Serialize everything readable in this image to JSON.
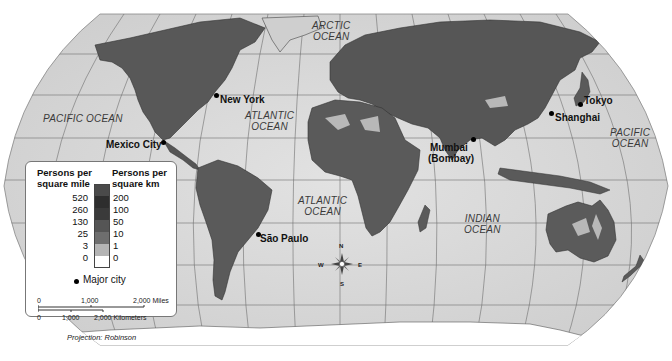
{
  "map": {
    "title": "World Population Density",
    "projection_label": "Projection: Robinson",
    "oceans": [
      {
        "name": "ARCTIC\nOCEAN",
        "line1": "ARCTIC",
        "line2": "OCEAN"
      },
      {
        "name": "PACIFIC OCEAN",
        "line1": "PACIFIC OCEAN",
        "line2": ""
      },
      {
        "name": "ATLANTIC OCEAN",
        "line1": "ATLANTIC",
        "line2": "OCEAN"
      },
      {
        "name": "ATLANTIC OCEAN",
        "line1": "ATLANTIC",
        "line2": "OCEAN"
      },
      {
        "name": "INDIAN OCEAN",
        "line1": "INDIAN",
        "line2": "OCEAN"
      },
      {
        "name": "PACIFIC OCEAN",
        "line1": "PACIFIC",
        "line2": "OCEAN"
      }
    ],
    "cities": [
      {
        "name": "New York"
      },
      {
        "name": "Mexico City"
      },
      {
        "name": "São Paulo"
      },
      {
        "name": "Mumbai",
        "alt": "(Bombay)"
      },
      {
        "name": "Shanghai"
      },
      {
        "name": "Tokyo"
      }
    ],
    "compass": {
      "n": "N",
      "s": "S",
      "e": "E",
      "w": "W"
    }
  },
  "legend": {
    "header_left_1": "Persons per",
    "header_left_2": "square mile",
    "header_right_1": "Persons per",
    "header_right_2": "square km",
    "rows": [
      {
        "mile": "520",
        "km": "200",
        "color": "#4a4a4a"
      },
      {
        "mile": "260",
        "km": "100",
        "color": "#2e2e2e"
      },
      {
        "mile": "130",
        "km": "50",
        "color": "#3a3a3a"
      },
      {
        "mile": "25",
        "km": "10",
        "color": "#555555"
      },
      {
        "mile": "3",
        "km": "1",
        "color": "#6e6e6e"
      },
      {
        "mile": "0",
        "km": "0",
        "color": "#b4b4b4"
      },
      {
        "mile": "",
        "km": "",
        "color": "#ffffff"
      }
    ],
    "major_city_label": "Major city",
    "scale": {
      "miles": [
        "0",
        "1,000",
        "2,000 Miles"
      ],
      "km": [
        "0",
        "1,000",
        "2,000 Kilometers"
      ]
    }
  }
}
